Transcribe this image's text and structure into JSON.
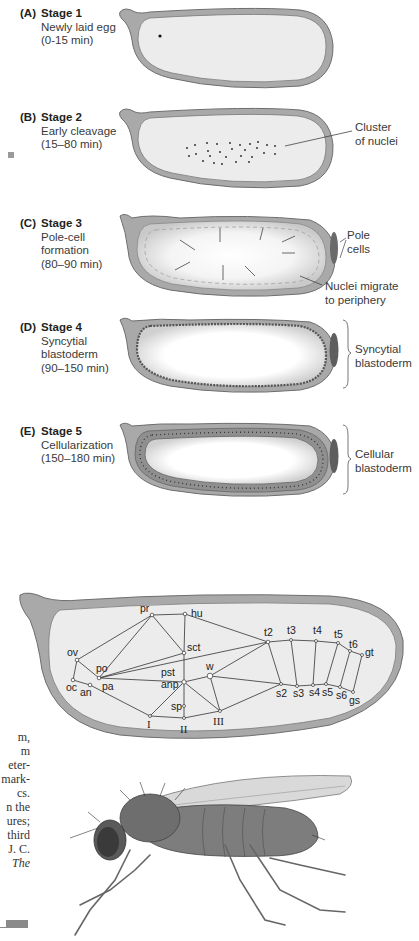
{
  "figure": {
    "stages": [
      {
        "letter": "(A)",
        "title": "Stage 1",
        "lines": [
          "Newly laid egg",
          "(0-15 min)"
        ]
      },
      {
        "letter": "(B)",
        "title": "Stage 2",
        "lines": [
          "Early cleavage",
          "(15–80 min)"
        ]
      },
      {
        "letter": "(C)",
        "title": "Stage 3",
        "lines": [
          "Pole-cell",
          "formation",
          "(80–90 min)"
        ]
      },
      {
        "letter": "(D)",
        "title": "Stage 4",
        "lines": [
          "Syncytial",
          "blastoderm",
          "(90–150 min)"
        ]
      },
      {
        "letter": "(E)",
        "title": "Stage 5",
        "lines": [
          "Cellularization",
          "(150–180 min)"
        ]
      }
    ],
    "annotations": {
      "cluster": [
        "Cluster",
        "of nuclei"
      ],
      "pole_cells": [
        "Pole",
        "cells"
      ],
      "nuclei_migrate": [
        "Nuclei migrate",
        "to periphery"
      ],
      "syncytial": [
        "Syncytial",
        "blastoderm"
      ],
      "cellular": [
        "Cellular",
        "blastoderm"
      ]
    },
    "fate_map": {
      "labels": [
        "pr",
        "hu",
        "ov",
        "po",
        "sct",
        "pst",
        "anp",
        "w",
        "oc",
        "an",
        "pa",
        "sp",
        "t2",
        "t3",
        "t4",
        "t5",
        "t6",
        "gt",
        "s2",
        "s3",
        "s4",
        "s5",
        "s6",
        "gs"
      ],
      "roman": [
        "I",
        "II",
        "III"
      ]
    },
    "margin_caption_fragments": [
      "m,",
      "m",
      "eter-",
      "mark-",
      "cs.",
      "n the",
      "ures;",
      "third",
      "J. C.",
      "The"
    ],
    "colors": {
      "shell": "#a9a9a9",
      "shell_stroke": "#6e6e6e",
      "yolk": "#ececec",
      "cell_ring": "#9a9a9a",
      "text": "#231f20"
    }
  }
}
